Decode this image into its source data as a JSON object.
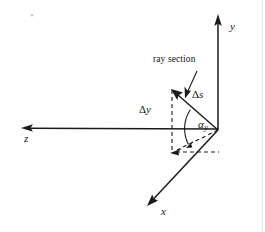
{
  "figure": {
    "type": "vector-diagram",
    "background_color": "#ffffff",
    "ink_color": "#1a1a1a",
    "width": 265,
    "height": 232
  },
  "axes": [
    {
      "id": "y-axis",
      "label": "y",
      "direction": "up",
      "from": [
        218,
        130
      ],
      "to": [
        218,
        16
      ],
      "arrow": true
    },
    {
      "id": "z-axis",
      "label": "z",
      "direction": "left",
      "from": [
        218,
        129
      ],
      "to": [
        22,
        128
      ],
      "arrow": true
    },
    {
      "id": "x-axis",
      "label": "x",
      "direction": "down-left",
      "from": [
        218,
        130
      ],
      "to": [
        148,
        205
      ],
      "arrow": true
    }
  ],
  "vectors": [
    {
      "id": "ray-section-vector",
      "label": "Δs",
      "label_delta": "Δ",
      "label_var": "s",
      "from": [
        218,
        130
      ],
      "to": [
        172,
        90
      ],
      "arrow": true,
      "style": "solid"
    }
  ],
  "projections": [
    {
      "id": "delta-y-segment",
      "label": "Δy",
      "label_delta": "Δ",
      "label_var": "y",
      "from": [
        172,
        90
      ],
      "to": [
        172,
        152
      ],
      "style": "dashed"
    },
    {
      "id": "horizontal-projection",
      "from": [
        172,
        152
      ],
      "to": [
        218,
        152
      ],
      "style": "dashed"
    },
    {
      "id": "diagonal-projection",
      "from": [
        218,
        130
      ],
      "to": [
        171,
        152
      ],
      "style": "dashed",
      "arrow": true
    }
  ],
  "angles": [
    {
      "id": "alpha-y-angle",
      "symbol": "α",
      "subscript": "y",
      "vertex": [
        218,
        130
      ],
      "between": [
        "ray-section-vector",
        "diagonal-projection"
      ],
      "arc_radius": 34
    }
  ],
  "annotations": [
    {
      "id": "ray-section-caption",
      "text": "ray section",
      "position": [
        153,
        55
      ],
      "leader_from": [
        197,
        72
      ],
      "leader_to": [
        186,
        97
      ],
      "leader_arrow": true
    }
  ]
}
